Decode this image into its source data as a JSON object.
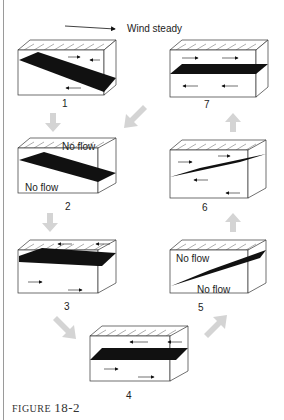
{
  "header": {
    "wind_label": "Wind steady"
  },
  "panels": [
    {
      "id": 1,
      "label": "1",
      "notes": []
    },
    {
      "id": 2,
      "label": "2",
      "notes": [
        "No flow",
        "No flow"
      ]
    },
    {
      "id": 3,
      "label": "3",
      "notes": []
    },
    {
      "id": 4,
      "label": "4",
      "notes": []
    },
    {
      "id": 5,
      "label": "5",
      "notes": [
        "No flow",
        "No flow"
      ]
    },
    {
      "id": 6,
      "label": "6",
      "notes": []
    },
    {
      "id": 7,
      "label": "7",
      "notes": []
    }
  ],
  "caption": {
    "prefix": "FIGURE",
    "number": "18-2"
  },
  "colors": {
    "ink": "#111111",
    "arrow_gray": "#d4d4d4",
    "edge": "#9a9a9a"
  }
}
